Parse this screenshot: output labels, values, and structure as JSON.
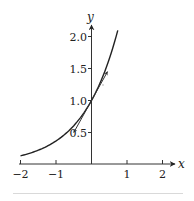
{
  "chart_data": {
    "type": "line",
    "title": "",
    "xlabel": "x",
    "ylabel": "y",
    "xlim": [
      -2,
      2.2
    ],
    "ylim": [
      0,
      2.1
    ],
    "grid": false,
    "legend": null,
    "x_ticks": [
      -2,
      -1,
      1,
      2
    ],
    "x_tick_labels": [
      "−2",
      "−1",
      "1",
      "2"
    ],
    "y_ticks": [
      0.5,
      1.0,
      1.5,
      2.0
    ],
    "y_tick_labels": [
      "0.5",
      "1.0",
      "1.5",
      "2.0"
    ],
    "series": [
      {
        "name": "y = e^x",
        "x": [
          -2.0,
          -1.75,
          -1.5,
          -1.25,
          -1.0,
          -0.75,
          -0.5,
          -0.25,
          0.0,
          0.25,
          0.5,
          0.74
        ],
        "y": [
          0.135,
          0.174,
          0.223,
          0.287,
          0.368,
          0.472,
          0.607,
          0.779,
          1.0,
          1.284,
          1.649,
          2.096
        ],
        "color": "#222222"
      },
      {
        "name": "tangent at (0,1): y = x + 1",
        "x": [
          -0.5,
          0.45
        ],
        "y": [
          0.5,
          1.45
        ],
        "color": "#333333",
        "style": "double-arrow segment"
      }
    ]
  }
}
